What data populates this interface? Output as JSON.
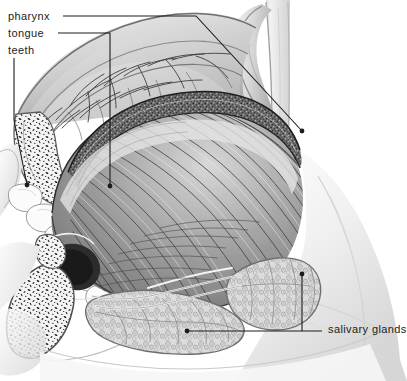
{
  "figure": {
    "kind": "anatomical-illustration",
    "style": "grayscale engraving / stipple-and-line medical drawing",
    "width": 407,
    "height": 381,
    "background_color": "#ffffff",
    "ink_color": "#1c1c1c",
    "label_font_size_px": 11
  },
  "labels": {
    "pharynx": "pharynx",
    "tongue": "tongue",
    "teeth": "teeth",
    "salivary_glands": "salivary glands"
  },
  "leader_lines": [
    {
      "label": "pharynx",
      "points": "63,16 196,16 302,131",
      "terminal": "dot",
      "terminal_point": [
        302,
        131
      ]
    },
    {
      "label": "tongue",
      "points": "58,33 110,33 110,186",
      "terminal": "dot",
      "terminal_point": [
        110,
        186
      ]
    },
    {
      "label": "teeth",
      "points": "14,58 14,120 27,185",
      "terminal": "dot",
      "terminal_point": [
        27,
        185
      ]
    },
    {
      "label": "salivary glands",
      "points": "187,331 322,331",
      "terminal": "dot",
      "terminal_point": [
        187,
        331
      ]
    },
    {
      "label": "salivary glands",
      "points": "302,331 302,274",
      "terminal": "dot",
      "terminal_point": [
        302,
        274
      ]
    }
  ],
  "anatomy_regions": [
    {
      "name": "hard-palate",
      "description": "arched roof of the mouth with branching palatine vessels"
    },
    {
      "name": "maxilla-bone",
      "description": "cut maxillary bone showing speckled trabecular marrow"
    },
    {
      "name": "upper-teeth",
      "description": "row of pale upper teeth at the left margin"
    },
    {
      "name": "tongue-dorsum",
      "description": "stippled papillated upper surface of the tongue"
    },
    {
      "name": "tongue-muscle",
      "description": "fan of radiating intrinsic tongue muscle fibres"
    },
    {
      "name": "uvula-soft-palate",
      "description": "soft palate and uvula hanging at the back of the mouth"
    },
    {
      "name": "pharynx-wall",
      "description": "posterior pharyngeal wall, vertical pale band at right"
    },
    {
      "name": "mandible-bone",
      "description": "cut mandible with dense trabecular speckle, lower left"
    },
    {
      "name": "sublingual-gland",
      "description": "lobulated salivary gland beneath the tongue"
    },
    {
      "name": "submandibular-gland",
      "description": "second lobulated salivary gland, lower right of floor of mouth"
    },
    {
      "name": "salivary-ducts",
      "description": "pale ducts running forward from the glands"
    },
    {
      "name": "neck-soft-tissue",
      "description": "soft graded shading of the neck and cheek at lower right"
    }
  ]
}
